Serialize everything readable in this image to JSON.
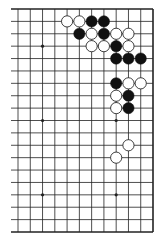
{
  "diagram": {
    "type": "go-board-fragment",
    "board_size": 19,
    "visible_columns": 12,
    "visible_rows": 19,
    "edges": {
      "top": true,
      "right": true,
      "bottom": true,
      "left": false
    },
    "colors": {
      "line": "#222222",
      "black_stone": "#111111",
      "white_stone": "#ffffff",
      "background": "#ffffff"
    },
    "star_points": [
      {
        "row": 3,
        "col": 2
      },
      {
        "row": 3,
        "col": 8
      },
      {
        "row": 9,
        "col": 2
      },
      {
        "row": 9,
        "col": 8
      },
      {
        "row": 15,
        "col": 2
      },
      {
        "row": 15,
        "col": 8
      }
    ],
    "stones": [
      {
        "row": 1,
        "col": 4,
        "color": "white"
      },
      {
        "row": 1,
        "col": 5,
        "color": "white"
      },
      {
        "row": 1,
        "col": 6,
        "color": "black"
      },
      {
        "row": 1,
        "col": 7,
        "color": "black"
      },
      {
        "row": 2,
        "col": 5,
        "color": "black"
      },
      {
        "row": 2,
        "col": 6,
        "color": "white"
      },
      {
        "row": 2,
        "col": 7,
        "color": "black"
      },
      {
        "row": 2,
        "col": 8,
        "color": "white"
      },
      {
        "row": 2,
        "col": 9,
        "color": "white"
      },
      {
        "row": 3,
        "col": 6,
        "color": "white"
      },
      {
        "row": 3,
        "col": 7,
        "color": "white"
      },
      {
        "row": 3,
        "col": 8,
        "color": "black"
      },
      {
        "row": 3,
        "col": 9,
        "color": "white"
      },
      {
        "row": 4,
        "col": 8,
        "color": "black"
      },
      {
        "row": 4,
        "col": 9,
        "color": "black"
      },
      {
        "row": 4,
        "col": 10,
        "color": "black"
      },
      {
        "row": 6,
        "col": 8,
        "color": "black"
      },
      {
        "row": 6,
        "col": 9,
        "color": "white"
      },
      {
        "row": 6,
        "col": 10,
        "color": "white"
      },
      {
        "row": 7,
        "col": 8,
        "color": "white"
      },
      {
        "row": 7,
        "col": 9,
        "color": "black"
      },
      {
        "row": 8,
        "col": 8,
        "color": "white"
      },
      {
        "row": 8,
        "col": 9,
        "color": "black"
      },
      {
        "row": 11,
        "col": 9,
        "color": "white"
      },
      {
        "row": 12,
        "col": 8,
        "color": "white"
      }
    ]
  }
}
